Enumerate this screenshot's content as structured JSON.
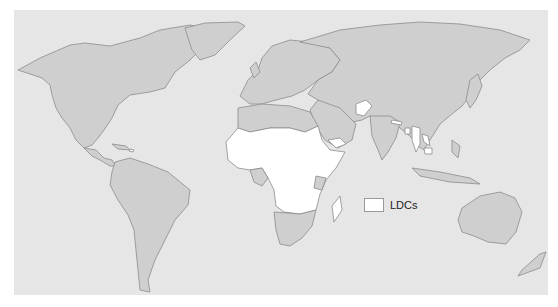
{
  "map": {
    "title": "",
    "projection": "world",
    "colors": {
      "ocean": "#e6e6e6",
      "land": "#cfcfcf",
      "ldc": "#ffffff",
      "border": "#8c8c8c"
    },
    "highlighted_regions": [
      "Sub-Saharan Africa LDCs",
      "Afghanistan",
      "Nepal",
      "Bangladesh",
      "Myanmar",
      "Laos",
      "Cambodia",
      "Yemen",
      "Madagascar",
      "Haiti"
    ]
  },
  "legend": {
    "items": [
      {
        "label": "LDCs",
        "color": "#ffffff"
      }
    ]
  }
}
